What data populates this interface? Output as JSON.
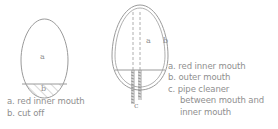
{
  "figure_left": {
    "labels": {
      "a": "a",
      "b": "b"
    },
    "legend": [
      "a. red inner mouth",
      "b. cut off"
    ]
  },
  "figure_right": {
    "labels": {
      "a": "a",
      "b": "b",
      "c": "c"
    },
    "legend": [
      "a. red inner mouth",
      "b. outer mouth",
      "c. pipe cleaner",
      "between mouth and",
      "inner mouth"
    ]
  },
  "colors": {
    "line": "#9a9a9a",
    "text": "#8f8f8f"
  }
}
